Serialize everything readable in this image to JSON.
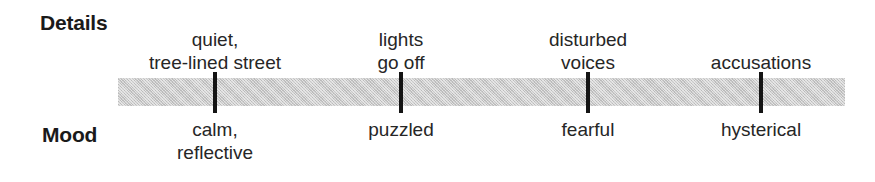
{
  "diagram": {
    "type": "timeline",
    "width": 875,
    "height": 182,
    "background_color": "#ffffff",
    "bar_color": "#c9c9c9",
    "tick_color": "#141414",
    "text_color": "#262626"
  },
  "rows": {
    "details_heading": "Details",
    "mood_heading": "Mood"
  },
  "chart_data": {
    "type": "table",
    "title": "",
    "xlabel": "",
    "ylabel": "",
    "categories": [
      "quiet, tree-lined street",
      "lights go off",
      "disturbed voices",
      "accusations"
    ],
    "series": [
      {
        "name": "Details",
        "values": [
          "quiet,\ntree-lined street",
          "lights\ngo off",
          "disturbed\nvoices",
          "accusations"
        ]
      },
      {
        "name": "Mood",
        "values": [
          "calm,\nreflective",
          "puzzled",
          "fearful",
          "hysterical"
        ]
      }
    ],
    "x": [
      215,
      401,
      588,
      761
    ]
  },
  "points": [
    {
      "detail": "quiet,\ntree-lined street",
      "mood": "calm,\nreflective",
      "x": 215
    },
    {
      "detail": "lights\ngo off",
      "mood": "puzzled",
      "x": 401
    },
    {
      "detail": "disturbed\nvoices",
      "mood": "fearful",
      "x": 588
    },
    {
      "detail": "accusations",
      "mood": "hysterical",
      "x": 761
    }
  ]
}
